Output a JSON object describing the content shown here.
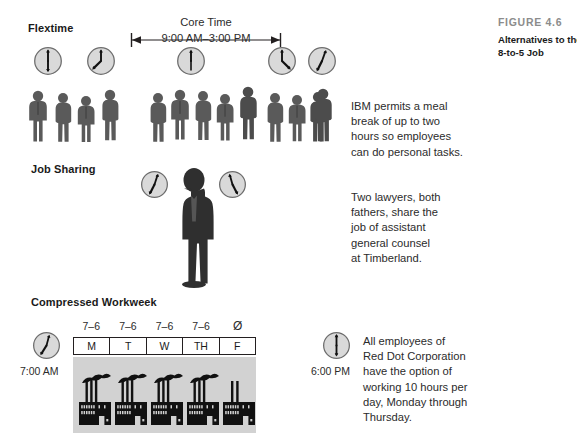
{
  "caption": {
    "label": "FIGURE 4.6",
    "title_lines": [
      "Alternatives to the",
      "8-to-5 Job"
    ]
  },
  "sections": {
    "flextime": {
      "title": "Flextime",
      "core_time": {
        "label": "Core Time",
        "range": "9:00 AM–3:00 PM"
      },
      "callout_lines": [
        "IBM permits a meal",
        "break of up to two",
        "hours so employees",
        "can do personal tasks."
      ],
      "clocks": [
        {
          "name": "clock-6-00",
          "hour": 6,
          "minute": 0
        },
        {
          "name": "clock-8-00",
          "hour": 8,
          "minute": 0
        },
        {
          "name": "clock-12-00",
          "hour": 12,
          "minute": 0
        },
        {
          "name": "clock-4-30",
          "hour": 4,
          "minute": 30
        },
        {
          "name": "clock-5-20",
          "hour": 5,
          "minute": 20
        }
      ],
      "people_groups": [
        4,
        5,
        3,
        1
      ]
    },
    "job_sharing": {
      "title": "Job Sharing",
      "callout_lines": [
        "Two lawyers, both",
        "fathers, share the",
        "job of assistant",
        "general counsel",
        "at Timberland."
      ],
      "clocks": [
        {
          "name": "clock-left-8-20",
          "hour": 8,
          "minute": 20
        },
        {
          "name": "clock-right-1-40",
          "hour": 1,
          "minute": 40
        }
      ]
    },
    "compressed_workweek": {
      "title": "Compressed Workweek",
      "hours_row": [
        "7–6",
        "7–6",
        "7–6",
        "7–6",
        "Ø"
      ],
      "days_row": [
        "M",
        "T",
        "W",
        "TH",
        "F"
      ],
      "start_time": "7:00 AM",
      "end_time": "6:00 PM",
      "start_clock": {
        "name": "clock-7-00",
        "hour": 7,
        "minute": 0
      },
      "end_clock": {
        "name": "clock-6-00",
        "hour": 6,
        "minute": 0
      },
      "factories": [
        {
          "stacks": 3,
          "smoke": true
        },
        {
          "stacks": 3,
          "smoke": true
        },
        {
          "stacks": 3,
          "smoke": true
        },
        {
          "stacks": 3,
          "smoke": true
        },
        {
          "stacks": 2,
          "smoke": false
        }
      ],
      "callout_lines": [
        "All employees of",
        "Red Dot Corporation",
        "have the option of",
        "working 10 hours per",
        "day, Monday through",
        "Thursday."
      ]
    }
  },
  "colors": {
    "background": "#ffffff",
    "text": "#231f20",
    "caption_label": "#8c8c8c",
    "clock_face": "#d9d9d9",
    "clock_rim": "#6e6e6e",
    "person": "#5a5a5a",
    "suit_person": "#2b2b2b",
    "panel": "#d2d2d2",
    "factory": "#111111"
  }
}
